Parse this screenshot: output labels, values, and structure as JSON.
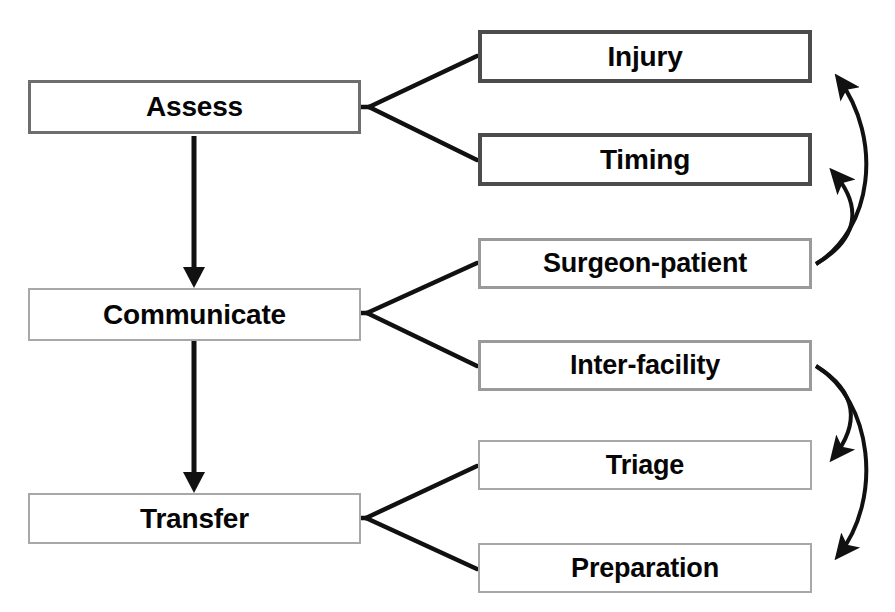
{
  "diagram": {
    "type": "flowchart",
    "background_color": "#ffffff",
    "text_color": "#060606",
    "line_color": "#111111",
    "stages": [
      {
        "id": "assess",
        "label": "Assess",
        "children": [
          {
            "id": "injury",
            "label": "Injury"
          },
          {
            "id": "timing",
            "label": "Timing"
          }
        ]
      },
      {
        "id": "communicate",
        "label": "Communicate",
        "children": [
          {
            "id": "surgeon-patient",
            "label": "Surgeon-patient"
          },
          {
            "id": "inter-facility",
            "label": "Inter-facility"
          }
        ]
      },
      {
        "id": "transfer",
        "label": "Transfer",
        "children": [
          {
            "id": "triage",
            "label": "Triage"
          },
          {
            "id": "preparation",
            "label": "Preparation"
          }
        ]
      }
    ],
    "feedback_arrows": [
      {
        "from": "surgeon-patient",
        "to": "injury"
      },
      {
        "from": "surgeon-patient",
        "to": "timing"
      },
      {
        "from": "inter-facility",
        "to": "triage"
      },
      {
        "from": "inter-facility",
        "to": "preparation"
      }
    ]
  }
}
